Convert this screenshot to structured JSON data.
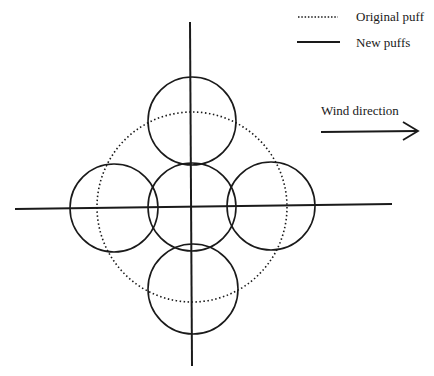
{
  "legend": {
    "items": [
      {
        "label": "Original puff",
        "style": "dotted"
      },
      {
        "label": "New puffs",
        "style": "solid"
      }
    ]
  },
  "wind": {
    "label": "Wind direction"
  },
  "colors": {
    "ink": "#1a1a1a",
    "background": "#ffffff"
  },
  "geometry": {
    "original_puff": {
      "cx": 192,
      "cy": 207,
      "r": 95
    },
    "new_puffs": [
      {
        "name": "top",
        "cx": 192,
        "cy": 121,
        "r": 44
      },
      {
        "name": "left",
        "cx": 114,
        "cy": 208,
        "r": 44
      },
      {
        "name": "center",
        "cx": 192,
        "cy": 207,
        "r": 44
      },
      {
        "name": "right",
        "cx": 271,
        "cy": 206,
        "r": 44
      },
      {
        "name": "bottom",
        "cx": 193,
        "cy": 289,
        "r": 45
      }
    ]
  }
}
